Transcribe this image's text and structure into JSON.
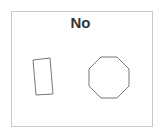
{
  "title": "No",
  "shapes": [
    {
      "type": "rectangle",
      "rotated": true
    },
    {
      "type": "octagon"
    }
  ],
  "colors": {
    "stroke": "#777777",
    "frame": "#c8c8c8",
    "text": "#333333"
  }
}
